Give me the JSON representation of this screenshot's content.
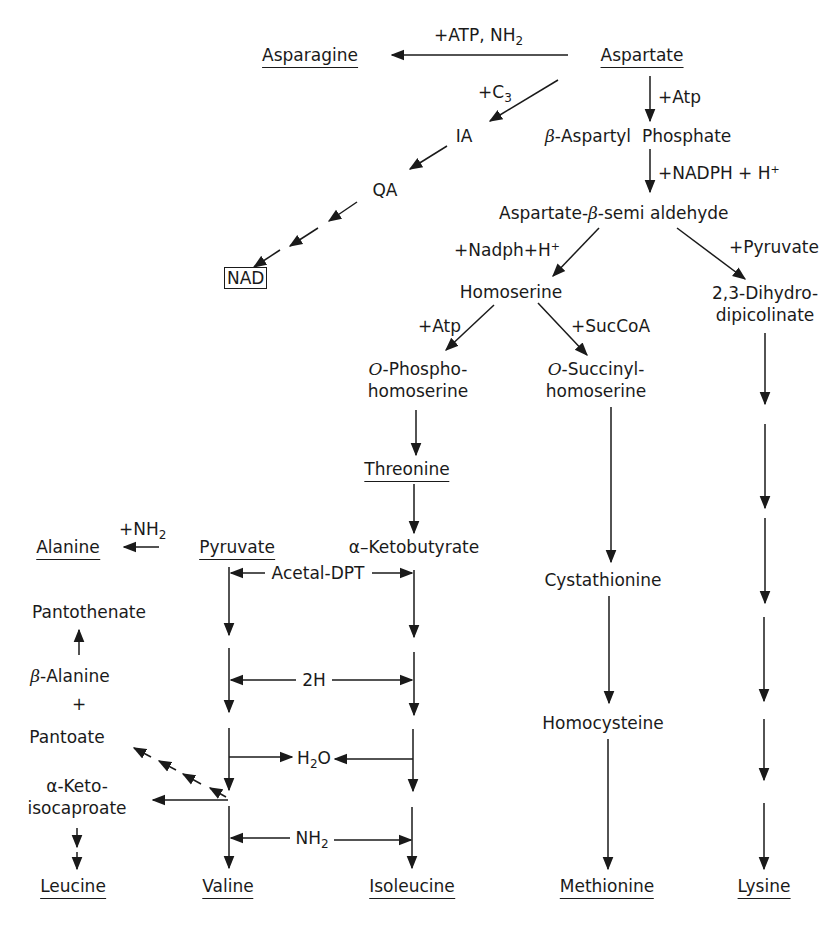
{
  "diagram": {
    "type": "metabolic-pathway",
    "title": "",
    "nodes": {
      "aspartate": "Aspartate",
      "asparagine": "Asparagine",
      "ia": "IA",
      "qa": "QA",
      "nad": "NAD",
      "b_aspartyl_phosphate_prefix": "β",
      "b_aspartyl_phosphate": "-Aspartyl  Phosphate",
      "asa_pre": "Aspartate-",
      "asa_greek": "β",
      "asa_post": "-semi aldehyde",
      "homoserine": "Homoserine",
      "dhdp_line1": "2,3-Dihydro-",
      "dhdp_line2": "dipicolinate",
      "ophos_prefix": "O",
      "ophos_line1": "-Phospho-",
      "ophos_line2": "homoserine",
      "osucc_prefix": "O",
      "osucc_line1": "-Succinyl-",
      "osucc_line2": "homoserine",
      "threonine": "Threonine",
      "ketobutyrate": "α–Ketobutyrate",
      "alanine": "Alanine",
      "pyruvate": "Pyruvate",
      "pantothenate": "Pantothenate",
      "b_alanine_greek": "β",
      "b_alanine": "-Alanine",
      "plus": "+",
      "pantoate": "Pantoate",
      "ketoiso_line1": "α-Keto-",
      "ketoiso_line2": "isocaproate",
      "cystathionine": "Cystathionine",
      "homocysteine": "Homocysteine",
      "leucine": "Leucine",
      "valine": "Valine",
      "isoleucine": "Isoleucine",
      "methionine": "Methionine",
      "lysine": "Lysine"
    },
    "edge_labels": {
      "atp_nh2_main": "+ATP, NH",
      "atp_nh2_sub": "2",
      "c3_main": "+C",
      "c3_sub": "3",
      "atp1": "+Atp",
      "nadph_main": "+NADPH + H",
      "nadph_sup": "+",
      "nadph2_main": "+Nadph+H",
      "nadph2_sup": "+",
      "pyruvate_add": "+Pyruvate",
      "atp2": "+Atp",
      "succoa": "+SucCoA",
      "nh2_ala_main": "+NH",
      "nh2_ala_sub": "2",
      "acetal_dpt": "Acetal-DPT",
      "two_h": "2H",
      "h2o_a": "H",
      "h2o_sub": "2",
      "h2o_b": "O",
      "nh2_main": "NH",
      "nh2_sub": "2"
    },
    "underlined_end_products": [
      "Asparagine",
      "Aspartate",
      "Threonine",
      "Alanine",
      "Pyruvate",
      "Leucine",
      "Valine",
      "Isoleucine",
      "Methionine",
      "Lysine"
    ],
    "boxed_products": [
      "NAD"
    ],
    "colors": {
      "ink": "#1a1a1a",
      "background": "#ffffff"
    }
  }
}
